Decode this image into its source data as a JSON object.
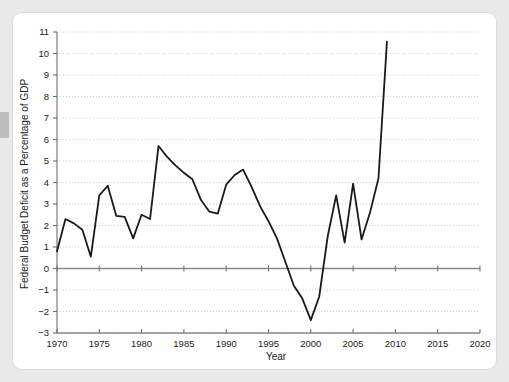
{
  "chart_data": {
    "type": "line",
    "title": "",
    "xlabel": "Year",
    "ylabel": "Federal Budget Deficit as a Percentage of GDP",
    "xlim": [
      1970,
      2020
    ],
    "ylim": [
      -3,
      11
    ],
    "xticks": [
      1970,
      1975,
      1980,
      1985,
      1990,
      1995,
      2000,
      2005,
      2010,
      2015,
      2020
    ],
    "yticks": [
      -3,
      -2,
      -1,
      0,
      1,
      2,
      3,
      4,
      5,
      6,
      7,
      8,
      9,
      10,
      11
    ],
    "xtick_labels": [
      "1970",
      "1975",
      "1980",
      "1985",
      "1990",
      "1995",
      "2000",
      "2005",
      "2010",
      "2015",
      "2020"
    ],
    "ytick_labels": [
      "−3",
      "−2",
      "−1",
      "0",
      "1",
      "2",
      "3",
      "4",
      "5",
      "6",
      "7",
      "8",
      "9",
      "10",
      "11"
    ],
    "grid": "horizontal-dotted",
    "legend": "none",
    "zero_line": true,
    "line_color": "#1a1a1a",
    "grid_color": "#c8c8c8",
    "axis_color": "#808080",
    "x": [
      1970,
      1971,
      1972,
      1973,
      1974,
      1975,
      1976,
      1977,
      1978,
      1979,
      1980,
      1981,
      1982,
      1983,
      1984,
      1985,
      1986,
      1987,
      1988,
      1989,
      1990,
      1991,
      1992,
      1993,
      1994,
      1995,
      1996,
      1997,
      1998,
      1999,
      2000,
      2001,
      2002,
      2003,
      2004,
      2005,
      2006,
      2007,
      2008,
      2009
    ],
    "values": [
      0.8,
      2.3,
      2.1,
      1.8,
      0.55,
      3.4,
      3.85,
      2.45,
      2.4,
      1.4,
      2.5,
      2.3,
      5.7,
      5.2,
      4.8,
      4.45,
      4.15,
      3.2,
      2.65,
      2.55,
      3.9,
      4.35,
      4.6,
      3.8,
      2.9,
      2.2,
      1.4,
      0.3,
      -0.8,
      -1.4,
      -2.4,
      -1.3,
      1.5,
      3.4,
      1.2,
      3.95,
      1.35,
      2.6,
      4.2,
      10.55
    ],
    "series_name": "Federal Budget Deficit as a Percentage of GDP",
    "notes": {
      "max_label": "10.55",
      "max_year": "2009",
      "min_label": "-2.4",
      "min_year": "2000"
    }
  }
}
